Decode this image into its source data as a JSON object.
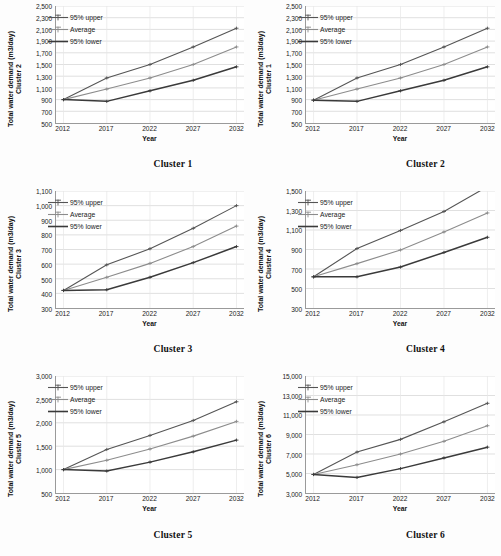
{
  "figure": {
    "series_colors": {
      "upper": "#555555",
      "average": "#8c8c8c",
      "lower": "#3a3a3a",
      "grid": "#d2d2d2",
      "axis": "#9a9a9a"
    },
    "legend_labels": {
      "upper": "95% upper",
      "average": "Average",
      "lower": "95% lower"
    },
    "axis_titles": {
      "y_main": "Total water demand  (m3/day)",
      "x": "Year"
    }
  },
  "panels": [
    {
      "caption": "Cluster 1",
      "y_axis_cluster_label": "Cluster 2",
      "chart_data": {
        "type": "line",
        "title": "Cluster 1",
        "xlabel": "Year",
        "ylabel": "Total water demand  (m3/day)",
        "categories": [
          2012,
          2017,
          2022,
          2027,
          2032
        ],
        "ticklabels": [
          "2012",
          "2017",
          "2022",
          "2027",
          "2032"
        ],
        "yticks": [
          500,
          700,
          900,
          1100,
          1300,
          1500,
          1700,
          1900,
          2100,
          2300,
          2500
        ],
        "yticklabels": [
          "500",
          "700",
          "900",
          "1,100",
          "1,300",
          "1,500",
          "1,700",
          "1,900",
          "2,100",
          "2,300",
          "2,500"
        ],
        "ylim": [
          500,
          2500
        ],
        "grid": true,
        "legend_position": "upper left",
        "series": [
          {
            "name": "95% upper",
            "values": [
              900,
              1270,
              1500,
              1800,
              2120
            ]
          },
          {
            "name": "Average",
            "values": [
              900,
              1080,
              1270,
              1500,
              1800
            ]
          },
          {
            "name": "95% lower",
            "values": [
              900,
              870,
              1050,
              1230,
              1460
            ]
          }
        ]
      }
    },
    {
      "caption": "Cluster 2",
      "y_axis_cluster_label": "Cluster 1",
      "chart_data": {
        "type": "line",
        "title": "Cluster 2",
        "xlabel": "Year",
        "ylabel": "Total water demand  (m3/day)",
        "categories": [
          2012,
          2017,
          2022,
          2027,
          2032
        ],
        "ticklabels": [
          "2012",
          "2017",
          "2022",
          "2027",
          "2032"
        ],
        "yticks": [
          500,
          700,
          900,
          1100,
          1300,
          1500,
          1700,
          1900,
          2100,
          2300,
          2500
        ],
        "yticklabels": [
          "500",
          "700",
          "900",
          "1,100",
          "1,300",
          "1,500",
          "1,700",
          "1,900",
          "2,100",
          "2,300",
          "2,500"
        ],
        "ylim": [
          500,
          2500
        ],
        "grid": true,
        "legend_position": "upper left",
        "series": [
          {
            "name": "95% upper",
            "values": [
              890,
              1270,
              1500,
              1800,
              2120
            ]
          },
          {
            "name": "Average",
            "values": [
              890,
              1080,
              1270,
              1500,
              1800
            ]
          },
          {
            "name": "95% lower",
            "values": [
              890,
              870,
              1050,
              1230,
              1460
            ]
          }
        ]
      }
    },
    {
      "caption": "Cluster 3",
      "y_axis_cluster_label": "Cluster 3",
      "chart_data": {
        "type": "line",
        "title": "Cluster 3",
        "xlabel": "Year",
        "ylabel": "Total water demand  (m3/day)",
        "categories": [
          2012,
          2017,
          2022,
          2027,
          2032
        ],
        "ticklabels": [
          "2012",
          "2017",
          "2022",
          "2027",
          "2032"
        ],
        "yticks": [
          300,
          400,
          500,
          600,
          700,
          800,
          900,
          1000,
          1100
        ],
        "yticklabels": [
          "300",
          "400",
          "500",
          "600",
          "700",
          "800",
          "900",
          "1,000",
          "1,100"
        ],
        "ylim": [
          300,
          1100
        ],
        "grid": true,
        "legend_position": "upper left",
        "series": [
          {
            "name": "95% upper",
            "values": [
              420,
              595,
              705,
              845,
              1000
            ]
          },
          {
            "name": "Average",
            "values": [
              420,
              510,
              605,
              720,
              860
            ]
          },
          {
            "name": "95% lower",
            "values": [
              420,
              425,
              510,
              610,
              720
            ]
          }
        ]
      }
    },
    {
      "caption": "Cluster 4",
      "y_axis_cluster_label": "Cluster 4",
      "chart_data": {
        "type": "line",
        "title": "Cluster 4",
        "xlabel": "Year",
        "ylabel": "Total water demand  (m3/day)",
        "categories": [
          2012,
          2017,
          2022,
          2027,
          2032
        ],
        "ticklabels": [
          "2012",
          "2017",
          "2022",
          "2027",
          "2032"
        ],
        "yticks": [
          300,
          500,
          700,
          900,
          1100,
          1300,
          1500
        ],
        "yticklabels": [
          "300",
          "500",
          "700",
          "900",
          "1,100",
          "1,300",
          "1,500"
        ],
        "ylim": [
          300,
          1500
        ],
        "grid": true,
        "legend_position": "upper left",
        "series": [
          {
            "name": "95% upper",
            "values": [
              620,
              910,
              1095,
              1290,
              1545
            ]
          },
          {
            "name": "Average",
            "values": [
              620,
              755,
              895,
              1080,
              1275
            ]
          },
          {
            "name": "95% lower",
            "values": [
              620,
              620,
              720,
              870,
              1025
            ]
          }
        ]
      }
    },
    {
      "caption": "Cluster 5",
      "y_axis_cluster_label": "Cluster 5",
      "chart_data": {
        "type": "line",
        "title": "Cluster 5",
        "xlabel": "Year",
        "ylabel": "Total water demand  (m3/day)",
        "categories": [
          2012,
          2017,
          2022,
          2027,
          2032
        ],
        "ticklabels": [
          "2012",
          "2017",
          "2022",
          "2027",
          "2032"
        ],
        "yticks": [
          500,
          1000,
          1500,
          2000,
          2500,
          3000
        ],
        "yticklabels": [
          "500",
          "1,000",
          "1,500",
          "2,000",
          "2,500",
          "3,000"
        ],
        "ylim": [
          500,
          3000
        ],
        "grid": true,
        "legend_position": "upper left",
        "series": [
          {
            "name": "95% upper",
            "values": [
              1000,
              1430,
              1730,
              2050,
              2450
            ]
          },
          {
            "name": "Average",
            "values": [
              1000,
              1200,
              1440,
              1715,
              2030
            ]
          },
          {
            "name": "95% lower",
            "values": [
              1000,
              970,
              1160,
              1380,
              1630
            ]
          }
        ]
      }
    },
    {
      "caption": "Cluster 6",
      "y_axis_cluster_label": "Cluster 6",
      "chart_data": {
        "type": "line",
        "title": "Cluster 6",
        "xlabel": "Year",
        "ylabel": "Total water demand  (m3/day)",
        "categories": [
          2012,
          2017,
          2022,
          2027,
          2032
        ],
        "ticklabels": [
          "2012",
          "2017",
          "2022",
          "2027",
          "2032"
        ],
        "yticks": [
          3000,
          5000,
          7000,
          9000,
          11000,
          13000,
          15000
        ],
        "yticklabels": [
          "3,000",
          "5,000",
          "7,000",
          "9,000",
          "11,000",
          "13,000",
          "15,000"
        ],
        "ylim": [
          3000,
          15000
        ],
        "grid": true,
        "legend_position": "upper left",
        "series": [
          {
            "name": "95% upper",
            "values": [
              4900,
              7200,
              8500,
              10300,
              12200
            ]
          },
          {
            "name": "Average",
            "values": [
              4900,
              5900,
              7000,
              8300,
              9900
            ]
          },
          {
            "name": "95% lower",
            "values": [
              4900,
              4600,
              5500,
              6600,
              7700
            ]
          }
        ]
      }
    }
  ]
}
